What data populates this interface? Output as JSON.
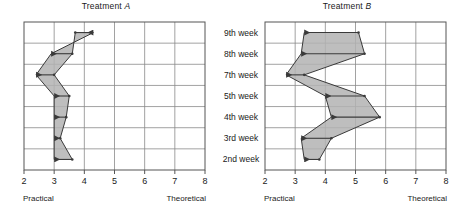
{
  "figure": {
    "background": "#ffffff",
    "axis_color": "#555555",
    "grid_color": "#8a8a8a",
    "series_color": "#3a3a3a",
    "fill_color": "#b3b3b3"
  },
  "week_axis": {
    "name": "week-axis",
    "labels": [
      "9th week",
      "8th week",
      "7th week",
      "5th week",
      "4th week",
      "3rd week",
      "2nd week"
    ]
  },
  "panels": [
    {
      "id": "a",
      "title_prefix": "Treatment ",
      "title_letter": "A",
      "left_label": "Practical",
      "right_label": "Theoretical",
      "ticks": [
        "2",
        "3",
        "4",
        "5",
        "6",
        "7",
        "8"
      ]
    },
    {
      "id": "b",
      "title_prefix": "Treatment ",
      "title_letter": "B",
      "left_label": "Practical",
      "right_label": "Theoretical",
      "ticks": [
        "2",
        "3",
        "4",
        "5",
        "6",
        "7",
        "8"
      ]
    }
  ],
  "chart_data": {
    "type": "line",
    "xlabel": "",
    "ylabel": "",
    "xlim": [
      2,
      8
    ],
    "xticks": [
      2,
      3,
      4,
      5,
      6,
      7,
      8
    ],
    "x_left_label": "Practical",
    "x_right_label": "Theoretical",
    "grid": true,
    "legend_position": "none",
    "categories": [
      "9th week",
      "8th week",
      "7th week",
      "5th week",
      "4th week",
      "3rd week",
      "2nd week"
    ],
    "charts": [
      {
        "name": "Treatment A",
        "series": [
          {
            "name": "Practical",
            "values": [
              4.3,
              2.9,
              2.4,
              3.0,
              3.0,
              3.0,
              3.0
            ]
          },
          {
            "name": "Theoretical",
            "values": [
              3.7,
              3.6,
              3.0,
              3.5,
              3.4,
              3.2,
              3.6
            ]
          }
        ]
      },
      {
        "name": "Treatment B",
        "series": [
          {
            "name": "Practical",
            "values": [
              3.3,
              3.2,
              2.7,
              4.0,
              4.2,
              3.2,
              3.3
            ]
          },
          {
            "name": "Theoretical",
            "values": [
              5.1,
              5.3,
              3.3,
              5.3,
              5.8,
              4.2,
              3.8
            ]
          }
        ]
      }
    ]
  }
}
